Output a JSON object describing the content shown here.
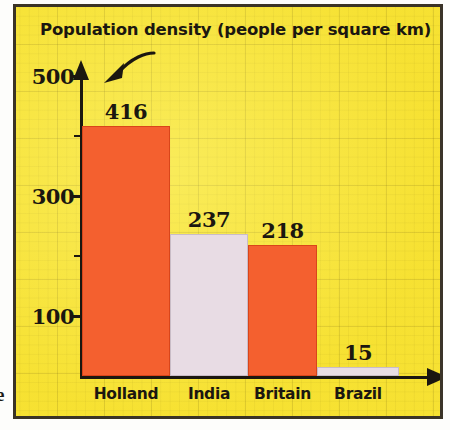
{
  "figure": {
    "title": "Population density (people per square km)",
    "background_color": "#f7e334",
    "frame_color": "#3a3326",
    "ink_color": "#1b1710",
    "margin_glyph": "e"
  },
  "axes": {
    "y_tick_labels": [
      "500",
      "300",
      "100"
    ],
    "y_minor_ticks": [
      400,
      200
    ],
    "x_arrow": "axis-arrow-right",
    "y_arrow": "axis-arrow-up"
  },
  "annotation": {
    "name": "curved-pointer-arrow"
  },
  "chart_data": {
    "type": "bar",
    "title": "Population density (people per square km)",
    "xlabel": "",
    "ylabel": "",
    "categories": [
      "Holland",
      "India",
      "Britain",
      "Brazil"
    ],
    "values": [
      416,
      237,
      218,
      15
    ],
    "value_labels": [
      "416",
      "237",
      "218",
      "15"
    ],
    "bar_colors": [
      "#f4602f",
      "#e8dce4",
      "#f4602f",
      "#e8dce4"
    ],
    "ylim": [
      0,
      500
    ],
    "yticks": [
      100,
      200,
      300,
      400,
      500
    ],
    "ytick_labels_shown": [
      "100",
      "300",
      "500"
    ],
    "grid": true,
    "legend": null
  }
}
